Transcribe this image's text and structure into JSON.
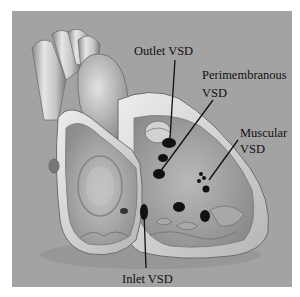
{
  "figure": {
    "background_color": "#a3a3a3",
    "labels": {
      "outlet": "Outlet VSD",
      "perimembranous_line1": "Perimembranous",
      "perimembranous_line2": "VSD",
      "muscular_line1": "Muscular",
      "muscular_line2": "VSD",
      "inlet": "Inlet VSD"
    }
  }
}
